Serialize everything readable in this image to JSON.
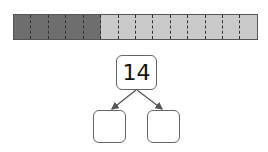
{
  "bar_model": {
    "total_segments": 14,
    "dark_segments": 5,
    "light_segments": 9,
    "colors": {
      "dark": "#6e6e6e",
      "light": "#cacaca"
    }
  },
  "number_bond": {
    "whole": "14",
    "part_left": "",
    "part_right": ""
  }
}
